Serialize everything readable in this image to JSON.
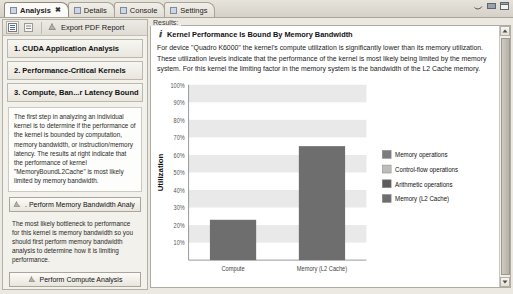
{
  "window": {
    "controls": [
      "restore-down",
      "minimize",
      "maximize"
    ]
  },
  "tabs": [
    {
      "label": "Analysis",
      "icon": "analysis-icon",
      "active": true,
      "closeable": true
    },
    {
      "label": "Details",
      "icon": "details-icon",
      "active": false,
      "closeable": false
    },
    {
      "label": "Console",
      "icon": "console-icon",
      "active": false,
      "closeable": false
    },
    {
      "label": "Settings",
      "icon": "settings-icon",
      "active": false,
      "closeable": false
    }
  ],
  "left_panel": {
    "toolbar": {
      "collapse_all_icon": "collapse-all-icon",
      "expand_all_icon": "expand-all-icon",
      "export_icon": "export-pdf-icon",
      "export_label": "Export PDF Report"
    },
    "sections": [
      {
        "label": "1. CUDA Application Analysis"
      },
      {
        "label": "2. Performance-Critical Kernels"
      },
      {
        "label": "3. Compute, Ban...r Latency Bound"
      }
    ],
    "description": "The first step in analyzing an individual kernel is to determine if the performance of the kernel is bounded by computation, memory bandwidth, or instruction/memory latency.  The results at right indicate that the performance of kernel \"MemoryBoundL2Cache\" is most likely limited by memory bandwidth.",
    "primary_button": {
      "label": ". Perform Memory Bandwidth Analy",
      "icon": "run-analysis-icon"
    },
    "hint": "The most likely bottleneck to performance for this kernel is memory bandwidth so you should first perform memory bandwidth analysis to determine how it is limiting performance.",
    "secondary_buttons": [
      {
        "label": "Perform Compute Analysis",
        "icon": "run-analysis-icon"
      },
      {
        "label": "Perform Latency Analysis",
        "icon": "run-analysis-icon"
      }
    ]
  },
  "results": {
    "group_label": "Results:",
    "info_icon": "info-icon",
    "title": "Kernel Performance Is Bound By Memory Bandwidth",
    "body": "For device \"Quadro K6000\" the kernel's compute utilization is significantly lower than its memory utilization. These utilization levels indicate that the performance of the kernel is most likely being limited by the memory system. For this kernel the limiting factor in the memory system is the bandwidth of the L2 Cache memory.",
    "scrollbar": {
      "up_icon": "scroll-up-icon",
      "down_icon": "scroll-down-icon"
    }
  },
  "chart_data": {
    "type": "bar",
    "title": "",
    "categories": [
      "Compute",
      "Memory (L2 Cache)"
    ],
    "values": [
      23,
      65
    ],
    "bar_colors": [
      "#6e6e6e",
      "#6e6e6e"
    ],
    "xlabel": "",
    "ylabel": "Utilization",
    "ylim": [
      0,
      100
    ],
    "ytick_labels": [
      "100%",
      "90%",
      "80%",
      "70%",
      "60%",
      "50%",
      "40%",
      "30%",
      "20%",
      "10%"
    ],
    "ytick_values": [
      100,
      90,
      80,
      70,
      60,
      50,
      40,
      30,
      20,
      10
    ],
    "grid": "horizontal-bands",
    "band_color": "#e9e9e9",
    "legend_position": "right",
    "legend": [
      {
        "label": "Memory operations",
        "color": "#7c7c7c"
      },
      {
        "label": "Control-flow operations",
        "color": "#bdbdbd"
      },
      {
        "label": "Arithmetic operations",
        "color": "#5c5c5c"
      },
      {
        "label": "Memory (L2 Cache)",
        "color": "#6e6e6e"
      }
    ]
  }
}
